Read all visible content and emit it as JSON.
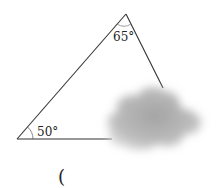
{
  "figure": {
    "type": "triangle",
    "angles": [
      {
        "vertex": "bottom-left",
        "label": "50°"
      },
      {
        "vertex": "top",
        "label": "65°"
      }
    ],
    "occluder": "cloud",
    "colors": {
      "line": "#333333",
      "cloud": "#9a9a9a"
    }
  },
  "caption": {
    "text": "("
  }
}
